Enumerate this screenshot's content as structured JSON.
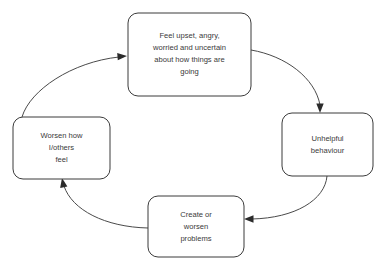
{
  "diagram": {
    "background_color": "#ffffff",
    "box_stroke_color": "#3b3b3b",
    "arrow_color": "#4a4a4a",
    "text_color": "#3a3a3a",
    "nodes": [
      {
        "id": "feelings",
        "position": "top",
        "text": "Feel upset, angry, worried and uncertain about how things are going",
        "lines": [
          "Feel upset, angry,",
          "worried and uncertain",
          "about how things are",
          "going"
        ]
      },
      {
        "id": "behaviour",
        "position": "right",
        "text": "Unhelpful behaviour",
        "lines": [
          "Unhelpful",
          "behaviour"
        ]
      },
      {
        "id": "problems",
        "position": "bottom",
        "text": "Create or worsen problems",
        "lines": [
          "Create or",
          "worsen",
          "problems"
        ]
      },
      {
        "id": "worsen-feelings",
        "position": "left",
        "text": "Worsen how I/others feel",
        "lines": [
          "Worsen how",
          "I/others",
          "feel"
        ]
      }
    ],
    "arrows": [
      {
        "id": "feelings-to-behaviour",
        "from": "feelings",
        "to": "behaviour",
        "direction": "clockwise"
      },
      {
        "id": "behaviour-to-problems",
        "from": "behaviour",
        "to": "problems",
        "direction": "clockwise"
      },
      {
        "id": "problems-to-worsen-feelings",
        "from": "problems",
        "to": "worsen-feelings",
        "direction": "clockwise"
      },
      {
        "id": "worsen-feelings-to-feelings",
        "from": "worsen-feelings",
        "to": "feelings",
        "direction": "clockwise"
      }
    ]
  }
}
